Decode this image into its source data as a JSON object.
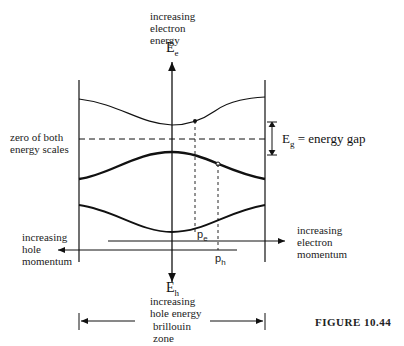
{
  "figure": {
    "caption": "FIGURE 10.44",
    "labels": {
      "electron_energy_axis": [
        "increasing",
        "electron",
        "energy"
      ],
      "ee_symbol": "E",
      "ee_sub": "e",
      "zero_label": [
        "zero of both",
        "energy scales"
      ],
      "eg_symbol": "E",
      "eg_sub": "g",
      "eg_text": "= energy gap",
      "hole_momentum": [
        "increasing",
        "hole",
        "momentum"
      ],
      "electron_momentum": [
        "increasing",
        "electron",
        "momentum"
      ],
      "eh_symbol": "E",
      "eh_sub": "h",
      "hole_energy": [
        "increasing",
        "hole energy"
      ],
      "brillouin": [
        "brillouin",
        "zone"
      ],
      "pe_symbol": "p",
      "pe_sub": "e",
      "ph_symbol": "p",
      "ph_sub": "h"
    }
  }
}
